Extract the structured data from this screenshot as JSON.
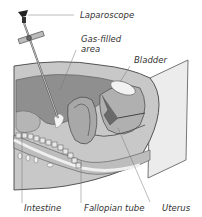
{
  "diagram": {
    "type": "medical-illustration",
    "labels": [
      {
        "id": "laparoscope",
        "text": "Laparoscope"
      },
      {
        "id": "gas",
        "text": "Gas-filled\narea",
        "line1": "Gas-filled",
        "line2": "area"
      },
      {
        "id": "bladder",
        "text": "Bladder"
      },
      {
        "id": "intestine",
        "text": "Intestine"
      },
      {
        "id": "fallopian",
        "text": "Fallopian tube"
      },
      {
        "id": "uterus",
        "text": "Uterus"
      }
    ],
    "colors": {
      "outline": "#444444",
      "tissue_dark": "#8a8a8a",
      "tissue_mid": "#a8a8a8",
      "tissue_light": "#c8c8c8",
      "skin_plane": "#ececec",
      "bladder_fill": "#f2f2f2",
      "text": "#333333"
    }
  }
}
